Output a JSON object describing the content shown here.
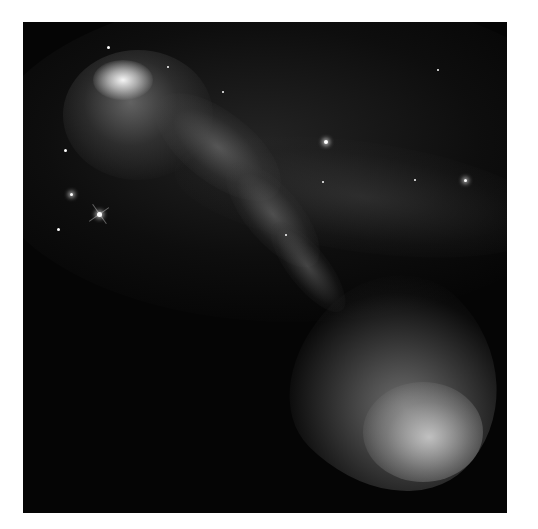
{
  "image": {
    "subject": "Herbig-Haro jet nebula",
    "description": "Grayscale astronomical image of a bright cloud at upper left with a wispy jet streaming diagonally to a large glowing bow-shaped cloud at lower right, on a dark starfield",
    "frame": {
      "left": 23,
      "top": 22,
      "width": 484,
      "height": 491,
      "background": "#050505",
      "border_color": "#ffffff"
    },
    "stars": [
      {
        "x": 85,
        "y": 25,
        "size": 3
      },
      {
        "x": 145,
        "y": 45,
        "size": 2
      },
      {
        "x": 200,
        "y": 70,
        "size": 2
      },
      {
        "x": 303,
        "y": 120,
        "size": 4,
        "glow": true
      },
      {
        "x": 42,
        "y": 128,
        "size": 3
      },
      {
        "x": 48,
        "y": 172,
        "size": 3,
        "glow": true
      },
      {
        "x": 76,
        "y": 192,
        "size": 5,
        "glow": true,
        "spikes": true
      },
      {
        "x": 35,
        "y": 207,
        "size": 3
      },
      {
        "x": 300,
        "y": 160,
        "size": 2
      },
      {
        "x": 392,
        "y": 158,
        "size": 2
      },
      {
        "x": 442,
        "y": 158,
        "size": 3,
        "glow": true
      },
      {
        "x": 415,
        "y": 48,
        "size": 2
      },
      {
        "x": 263,
        "y": 213,
        "size": 2
      }
    ]
  }
}
